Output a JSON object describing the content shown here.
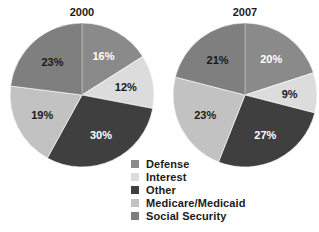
{
  "chart_data": [
    {
      "type": "pie",
      "title": "2000",
      "categories": [
        "Defense",
        "Interest",
        "Other",
        "Medicare/Medicaid",
        "Social Security"
      ],
      "values": [
        16,
        12,
        30,
        19,
        23
      ],
      "labels": [
        "16%",
        "12%",
        "30%",
        "19%",
        "23%"
      ],
      "colors": [
        "#8a8a8a",
        "#dcdcdc",
        "#3f3f3f",
        "#c2c2c2",
        "#7f7f7f"
      ]
    },
    {
      "type": "pie",
      "title": "2007",
      "categories": [
        "Defense",
        "Interest",
        "Other",
        "Medicare/Medicaid",
        "Social Security"
      ],
      "values": [
        20,
        9,
        27,
        23,
        21
      ],
      "labels": [
        "20%",
        "9%",
        "27%",
        "23%",
        "21%"
      ],
      "colors": [
        "#8a8a8a",
        "#dcdcdc",
        "#3f3f3f",
        "#c2c2c2",
        "#7f7f7f"
      ]
    }
  ],
  "legend": {
    "items": [
      {
        "label": "Defense",
        "color": "#8a8a8a"
      },
      {
        "label": "Interest",
        "color": "#dcdcdc"
      },
      {
        "label": "Other",
        "color": "#3f3f3f"
      },
      {
        "label": "Medicare/Medicaid",
        "color": "#c2c2c2"
      },
      {
        "label": "Social Security",
        "color": "#7f7f7f"
      }
    ],
    "position": "bottom-center"
  },
  "label_colors": {
    "Defense": "#ffffff",
    "Interest": "#1a1a1a",
    "Other": "#ffffff",
    "Medicare/Medicaid": "#1a1a1a",
    "Social Security": "#1a1a1a"
  }
}
